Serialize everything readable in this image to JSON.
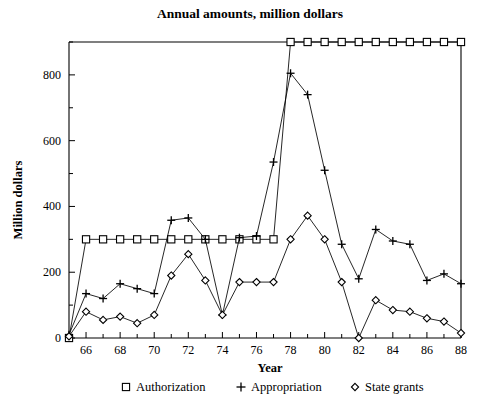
{
  "chart_data": {
    "type": "line",
    "title": "Annual amounts, million dollars",
    "xlabel": "Year",
    "ylabel": "Million dollars",
    "xlim": [
      65,
      88
    ],
    "ylim": [
      0,
      900
    ],
    "x": [
      65,
      66,
      67,
      68,
      69,
      70,
      71,
      72,
      73,
      74,
      75,
      76,
      77,
      78,
      79,
      80,
      81,
      82,
      83,
      84,
      85,
      86,
      87,
      88
    ],
    "x_tick_labels": [
      "66",
      "68",
      "70",
      "72",
      "74",
      "76",
      "78",
      "80",
      "82",
      "84",
      "86",
      "88"
    ],
    "x_tick_values": [
      66,
      68,
      70,
      72,
      74,
      76,
      78,
      80,
      82,
      84,
      86,
      88
    ],
    "x_minor_tick_values": [
      65,
      67,
      69,
      71,
      73,
      75,
      77,
      79,
      81,
      83,
      85,
      87
    ],
    "y_tick_labels": [
      "0",
      "200",
      "400",
      "600",
      "800"
    ],
    "y_tick_values": [
      0,
      200,
      400,
      600,
      800
    ],
    "y_minor_tick_values": [
      100,
      300,
      500,
      700,
      900
    ],
    "grid": false,
    "legend_position": "bottom",
    "series": [
      {
        "name": "Authorization",
        "marker": "square",
        "values": [
          0,
          300,
          300,
          300,
          300,
          300,
          300,
          300,
          300,
          300,
          300,
          300,
          300,
          900,
          900,
          900,
          900,
          900,
          900,
          900,
          900,
          900,
          900,
          900
        ]
      },
      {
        "name": "Appropriation",
        "marker": "plus",
        "values": [
          10,
          135,
          120,
          165,
          150,
          135,
          358,
          365,
          300,
          70,
          305,
          310,
          535,
          805,
          740,
          510,
          285,
          180,
          330,
          295,
          285,
          175,
          195,
          165
        ]
      },
      {
        "name": "State grants",
        "marker": "diamond",
        "values": [
          5,
          80,
          55,
          65,
          45,
          70,
          190,
          255,
          175,
          70,
          170,
          170,
          170,
          300,
          372,
          300,
          170,
          0,
          115,
          85,
          80,
          60,
          50,
          15
        ]
      }
    ]
  },
  "legend": {
    "items": [
      {
        "label": "Authorization",
        "marker": "square-marker"
      },
      {
        "label": "Appropriation",
        "marker": "plus-marker"
      },
      {
        "label": "State grants",
        "marker": "diamond-marker"
      }
    ]
  }
}
